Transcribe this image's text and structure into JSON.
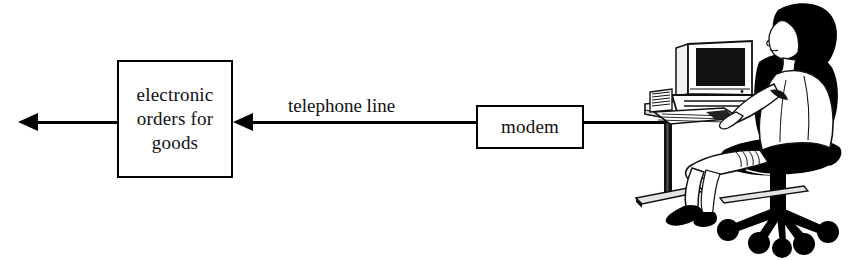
{
  "diagram": {
    "background_color": "#ffffff",
    "stroke_color": "#000000",
    "text_color": "#111111"
  },
  "nodes": [
    {
      "id": "orders",
      "label": "electronic orders for goods",
      "shape": "rectangle"
    },
    {
      "id": "modem",
      "label": "modem",
      "shape": "rectangle"
    },
    {
      "id": "workstation",
      "label": "person seated at desk using a computer",
      "shape": "illustration"
    }
  ],
  "edges": [
    {
      "id": "output-arrow",
      "from": "orders",
      "to": "external",
      "label": "",
      "arrow": "left"
    },
    {
      "id": "telephone-link",
      "from": "modem",
      "to": "orders",
      "label": "telephone line",
      "arrow": "left"
    },
    {
      "id": "modem-computer-link",
      "from": "workstation",
      "to": "modem",
      "label": "",
      "arrow": "none"
    }
  ],
  "illustration": {
    "name": "person-at-computer",
    "parts": [
      "monitor",
      "computer-case",
      "keyboard",
      "desk",
      "office-chair",
      "seated-person"
    ]
  }
}
